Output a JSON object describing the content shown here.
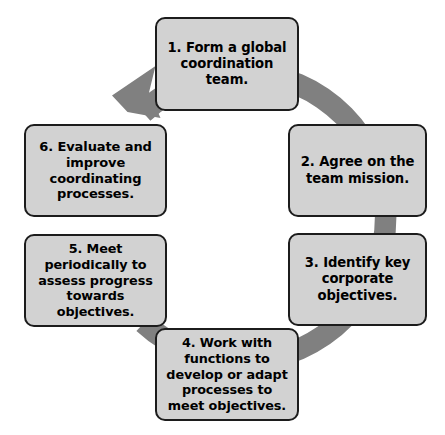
{
  "diagram": {
    "type": "cycle",
    "title": "",
    "direction": "clockwise",
    "arrow_color": "#808080",
    "box_fill": "#d2d2d2",
    "box_border": "#1c1c1c",
    "text_color": "#000000",
    "background": "#ffffff",
    "ring": {
      "center_x": 224,
      "center_y": 218,
      "outer_radius": 155,
      "thickness": 22,
      "arrowhead_angle_deg": 118
    },
    "steps": [
      {
        "number": "1",
        "name": "form-global-coordination-team",
        "label": "1. Form a global coordination team."
      },
      {
        "number": "2",
        "name": "agree-on-team-mission",
        "label": "2. Agree on the team mission."
      },
      {
        "number": "3",
        "name": "identify-key-corporate-objectives",
        "label": "3. Identify key corporate objectives."
      },
      {
        "number": "4",
        "name": "work-with-functions",
        "label": "4. Work with functions to develop or adapt processes to meet objectives."
      },
      {
        "number": "5",
        "name": "meet-periodically",
        "label": "5. Meet periodically to assess progress towards objectives."
      },
      {
        "number": "6",
        "name": "evaluate-and-improve",
        "label": "6. Evaluate and improve coordinating processes."
      }
    ]
  }
}
